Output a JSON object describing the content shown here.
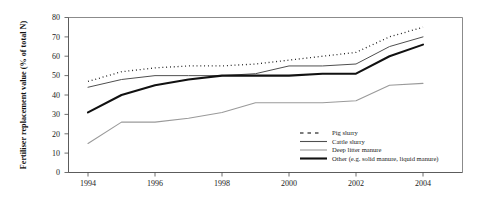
{
  "chart_data": {
    "type": "line",
    "title": "",
    "xlabel": "",
    "ylabel": "Fertiliser replacement value (% of total N)",
    "xlim": [
      1993.5,
      2004.8
    ],
    "ylim": [
      0,
      80
    ],
    "ytick_labels": [
      "0",
      "10",
      "20",
      "30",
      "40",
      "50",
      "60",
      "70",
      "80"
    ],
    "ytick_values": [
      0,
      10,
      20,
      30,
      40,
      50,
      60,
      70,
      80
    ],
    "xtick_labels": [
      "1994",
      "1996",
      "1998",
      "2000",
      "2002",
      "2004"
    ],
    "xtick_values": [
      1994,
      1996,
      1998,
      2000,
      2002,
      2004
    ],
    "minor_xticks": [
      1995,
      1997,
      1999,
      2001,
      2003
    ],
    "grid": false,
    "legend_position": "inner-bottom-right",
    "x": [
      1994,
      1995,
      1996,
      1997,
      1998,
      1999,
      2000,
      2001,
      2002,
      2003,
      2004
    ],
    "series": [
      {
        "name": "Pig slurry",
        "style": "dotted",
        "color": "#111111",
        "values": [
          47,
          52,
          54,
          55,
          55,
          56,
          58,
          60,
          62,
          70,
          75
        ]
      },
      {
        "name": "Cattle slurry",
        "style": "thin-solid",
        "color": "#555555",
        "values": [
          44,
          48,
          50,
          50,
          50,
          51,
          55,
          55,
          56,
          65,
          70
        ]
      },
      {
        "name": "Deep litter manure",
        "style": "thin-solid-light",
        "color": "#9a9a9a",
        "values": [
          15,
          26,
          26,
          28,
          31,
          36,
          36,
          36,
          37,
          45,
          46
        ]
      },
      {
        "name": "Other (e.g. solid manure, liquid manure)",
        "style": "thick-solid",
        "color": "#111111",
        "values": [
          31,
          40,
          45,
          48,
          50,
          50,
          50,
          51,
          51,
          60,
          66
        ]
      }
    ]
  },
  "legend": {
    "items": [
      {
        "label": "Pig slurry",
        "marker": "dotted-line-swatch"
      },
      {
        "label": "Cattle slurry",
        "marker": "thin-line-swatch"
      },
      {
        "label": "Deep litter manure",
        "marker": "thin-line-swatch"
      },
      {
        "label": "Other (e.g. solid manure, liquid manure)",
        "marker": "thick-line-swatch"
      }
    ]
  }
}
